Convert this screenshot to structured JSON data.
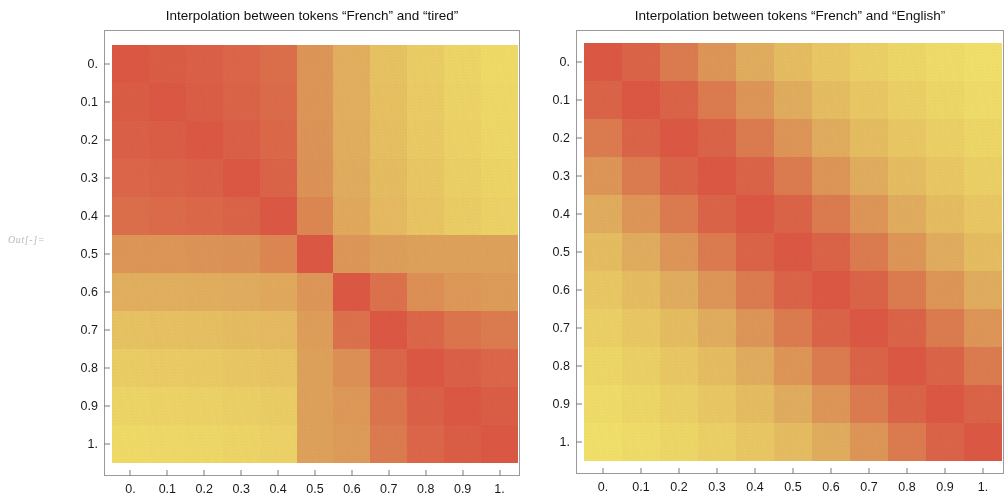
{
  "out_label": "Out[-]=",
  "palette": {
    "low": "#f8ec6e",
    "mid": "#e3a65e",
    "high": "#e05a46",
    "frame": "#9a9a9a",
    "tick": "#7d7d7d",
    "text": "#1a1a1a",
    "background": "#ffffff"
  },
  "plots": [
    {
      "id": "left",
      "title": "Interpolation between tokens “French” and “tired”",
      "xlabel": "",
      "ylabel": "",
      "ticks": [
        "0.",
        "0.1",
        "0.2",
        "0.3",
        "0.4",
        "0.5",
        "0.6",
        "0.7",
        "0.8",
        "0.9",
        "1."
      ]
    },
    {
      "id": "right",
      "title": "Interpolation between tokens “French” and “English”",
      "xlabel": "",
      "ylabel": "",
      "ticks": [
        "0.",
        "0.1",
        "0.2",
        "0.3",
        "0.4",
        "0.5",
        "0.6",
        "0.7",
        "0.8",
        "0.9",
        "1."
      ]
    }
  ],
  "chart_data": [
    {
      "type": "heatmap",
      "id": "left-heatmap",
      "title": "Interpolation between tokens “French” and “tired”",
      "xlabel": "",
      "ylabel": "",
      "x": [
        0,
        0.1,
        0.2,
        0.3,
        0.4,
        0.5,
        0.6,
        0.7,
        0.8,
        0.9,
        1
      ],
      "y": [
        0,
        0.1,
        0.2,
        0.3,
        0.4,
        0.5,
        0.6,
        0.7,
        0.8,
        0.9,
        1
      ],
      "xtick_labels": [
        "0.",
        "0.1",
        "0.2",
        "0.3",
        "0.4",
        "0.5",
        "0.6",
        "0.7",
        "0.8",
        "0.9",
        "1."
      ],
      "ytick_labels": [
        "0.",
        "0.1",
        "0.2",
        "0.3",
        "0.4",
        "0.5",
        "0.6",
        "0.7",
        "0.8",
        "0.9",
        "1."
      ],
      "xlim": [
        0,
        1
      ],
      "ylim": [
        0,
        1
      ],
      "grid": false,
      "legend": "none",
      "colorscale": [
        "#f8ec6e",
        "#e3a65e",
        "#e05a46"
      ],
      "zlim": [
        0,
        1
      ],
      "note": "y axis increases downward; value 1 = most similar (red), 0 = least similar (yellow)",
      "values": [
        [
          1.0,
          0.97,
          0.94,
          0.9,
          0.85,
          0.58,
          0.4,
          0.26,
          0.18,
          0.12,
          0.08
        ],
        [
          0.97,
          1.0,
          0.96,
          0.92,
          0.87,
          0.58,
          0.4,
          0.27,
          0.19,
          0.13,
          0.09
        ],
        [
          0.94,
          0.96,
          1.0,
          0.94,
          0.89,
          0.59,
          0.41,
          0.28,
          0.2,
          0.14,
          0.1
        ],
        [
          0.9,
          0.92,
          0.94,
          1.0,
          0.92,
          0.6,
          0.42,
          0.3,
          0.22,
          0.16,
          0.12
        ],
        [
          0.85,
          0.87,
          0.89,
          0.92,
          1.0,
          0.68,
          0.44,
          0.32,
          0.24,
          0.18,
          0.14
        ],
        [
          0.58,
          0.58,
          0.59,
          0.6,
          0.68,
          1.0,
          0.57,
          0.52,
          0.5,
          0.5,
          0.5
        ],
        [
          0.4,
          0.4,
          0.41,
          0.42,
          0.44,
          0.57,
          1.0,
          0.82,
          0.62,
          0.56,
          0.54
        ],
        [
          0.26,
          0.27,
          0.28,
          0.3,
          0.32,
          0.52,
          0.82,
          1.0,
          0.9,
          0.8,
          0.76
        ],
        [
          0.18,
          0.19,
          0.2,
          0.22,
          0.24,
          0.5,
          0.62,
          0.9,
          1.0,
          0.94,
          0.9
        ],
        [
          0.12,
          0.13,
          0.14,
          0.16,
          0.18,
          0.5,
          0.56,
          0.8,
          0.94,
          1.0,
          0.96
        ],
        [
          0.08,
          0.09,
          0.1,
          0.12,
          0.14,
          0.5,
          0.54,
          0.76,
          0.9,
          0.96,
          1.0
        ]
      ]
    },
    {
      "type": "heatmap",
      "id": "right-heatmap",
      "title": "Interpolation between tokens “French” and “English”",
      "xlabel": "",
      "ylabel": "",
      "x": [
        0,
        0.1,
        0.2,
        0.3,
        0.4,
        0.5,
        0.6,
        0.7,
        0.8,
        0.9,
        1
      ],
      "y": [
        0,
        0.1,
        0.2,
        0.3,
        0.4,
        0.5,
        0.6,
        0.7,
        0.8,
        0.9,
        1
      ],
      "xtick_labels": [
        "0.",
        "0.1",
        "0.2",
        "0.3",
        "0.4",
        "0.5",
        "0.6",
        "0.7",
        "0.8",
        "0.9",
        "1."
      ],
      "ytick_labels": [
        "0.",
        "0.1",
        "0.2",
        "0.3",
        "0.4",
        "0.5",
        "0.6",
        "0.7",
        "0.8",
        "0.9",
        "1."
      ],
      "xlim": [
        0,
        1
      ],
      "ylim": [
        0,
        1
      ],
      "grid": false,
      "legend": "none",
      "colorscale": [
        "#f8ec6e",
        "#e3a65e",
        "#e05a46"
      ],
      "zlim": [
        0,
        1
      ],
      "note": "smooth diagonal band; similarity decreases monotonically with distance from diagonal",
      "values": [
        [
          1.0,
          0.92,
          0.76,
          0.58,
          0.42,
          0.3,
          0.22,
          0.16,
          0.11,
          0.07,
          0.04
        ],
        [
          0.92,
          1.0,
          0.92,
          0.76,
          0.58,
          0.42,
          0.3,
          0.22,
          0.16,
          0.11,
          0.07
        ],
        [
          0.76,
          0.92,
          1.0,
          0.92,
          0.76,
          0.58,
          0.42,
          0.3,
          0.22,
          0.16,
          0.11
        ],
        [
          0.58,
          0.76,
          0.92,
          1.0,
          0.92,
          0.76,
          0.58,
          0.42,
          0.3,
          0.22,
          0.16
        ],
        [
          0.42,
          0.58,
          0.76,
          0.92,
          1.0,
          0.92,
          0.76,
          0.58,
          0.42,
          0.3,
          0.22
        ],
        [
          0.3,
          0.42,
          0.58,
          0.76,
          0.92,
          1.0,
          0.92,
          0.76,
          0.58,
          0.42,
          0.3
        ],
        [
          0.22,
          0.3,
          0.42,
          0.58,
          0.76,
          0.92,
          1.0,
          0.92,
          0.76,
          0.58,
          0.42
        ],
        [
          0.16,
          0.22,
          0.3,
          0.42,
          0.58,
          0.76,
          0.92,
          1.0,
          0.92,
          0.76,
          0.58
        ],
        [
          0.11,
          0.16,
          0.22,
          0.3,
          0.42,
          0.58,
          0.76,
          0.92,
          1.0,
          0.92,
          0.76
        ],
        [
          0.07,
          0.11,
          0.16,
          0.22,
          0.3,
          0.42,
          0.58,
          0.76,
          0.92,
          1.0,
          0.92
        ],
        [
          0.04,
          0.07,
          0.11,
          0.16,
          0.22,
          0.3,
          0.42,
          0.58,
          0.76,
          0.92,
          1.0
        ]
      ]
    }
  ]
}
